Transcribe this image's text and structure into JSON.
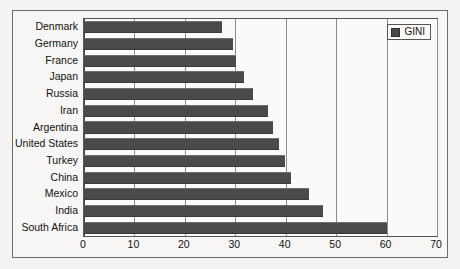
{
  "chart_data": {
    "type": "bar",
    "orientation": "horizontal",
    "title": "",
    "xlabel": "",
    "ylabel": "",
    "xlim": [
      0,
      70
    ],
    "xticks": [
      0,
      10,
      20,
      30,
      40,
      50,
      60,
      70
    ],
    "grid": true,
    "legend": {
      "position": "top-right",
      "entries": [
        {
          "label": "GINI",
          "color": "#4a4a4a",
          "swatch": "legend-swatch"
        }
      ]
    },
    "categories": [
      "Denmark",
      "Germany",
      "France",
      "Japan",
      "Russia",
      "Iran",
      "Argentina",
      "United States",
      "Turkey",
      "China",
      "Mexico",
      "India",
      "South Africa"
    ],
    "series": [
      {
        "name": "GINI",
        "color": "#4a4a4a",
        "values": [
          27.4,
          29.6,
          30.2,
          31.7,
          33.5,
          36.4,
          37.5,
          38.7,
          39.8,
          41.1,
          44.7,
          47.3,
          60.0
        ]
      }
    ]
  },
  "colors": {
    "bar": "#4a4a4a",
    "page_background": "#f4f3f1",
    "plot_background": "#fbfaf8",
    "frame_border": "#6b6b6b",
    "gridline": "#8d8d8d",
    "text": "#111111"
  }
}
